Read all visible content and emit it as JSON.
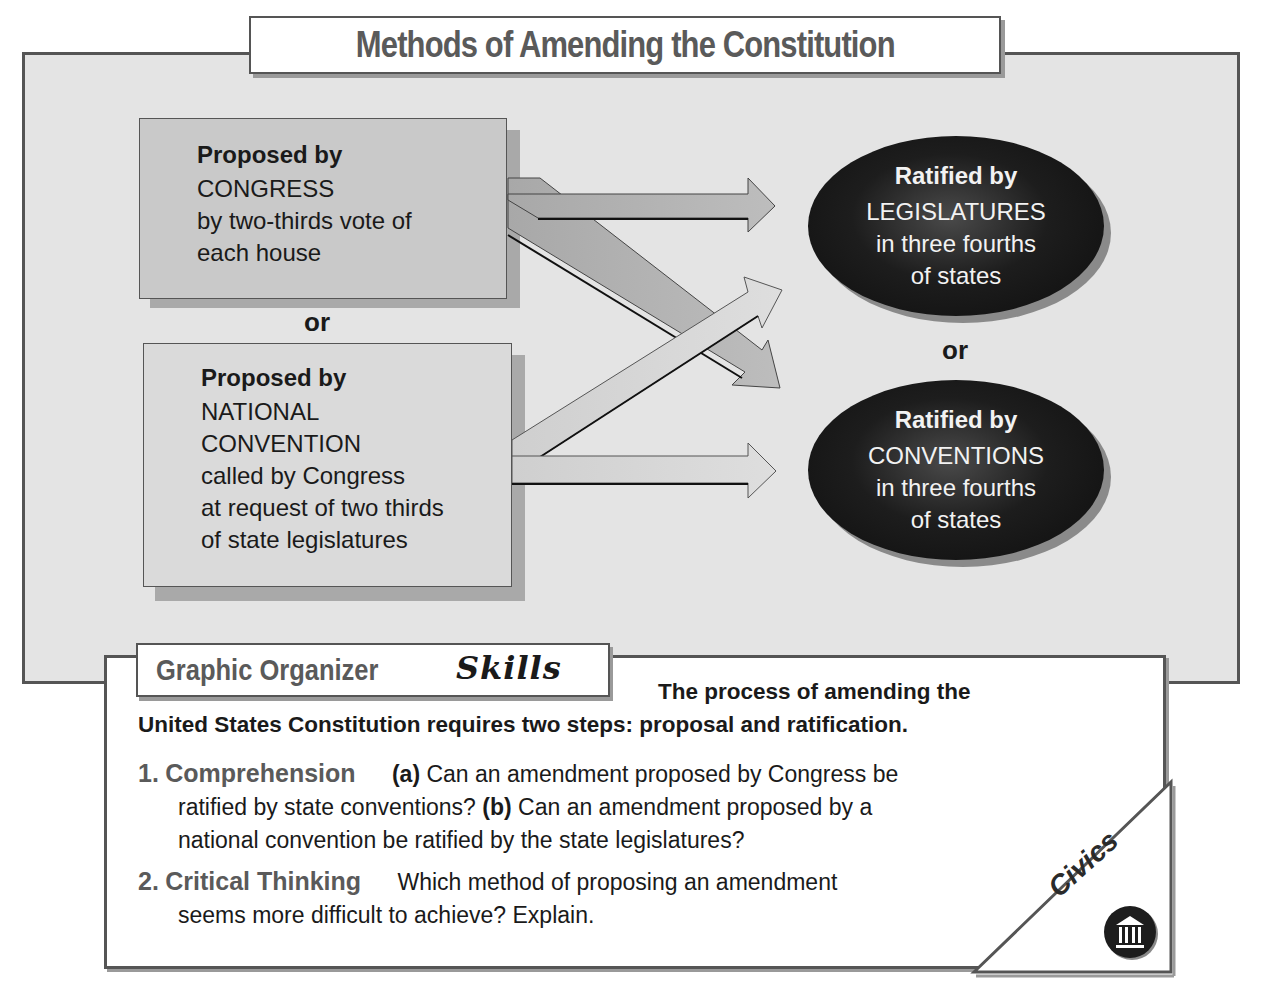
{
  "title": "Methods of Amending the Constitution",
  "proposal": {
    "congress": {
      "heading": "Proposed by",
      "lines": [
        "CONGRESS",
        "by two-thirds vote of",
        "each house"
      ]
    },
    "or": "or",
    "convention": {
      "heading": "Proposed by",
      "lines": [
        "NATIONAL",
        "CONVENTION",
        "called by Congress",
        "at request of two thirds",
        "of state legislatures"
      ]
    }
  },
  "ratification": {
    "legislatures": {
      "heading": "Ratified by",
      "lines": [
        "LEGISLATURES",
        "in three fourths",
        "of states"
      ]
    },
    "or": "or",
    "conventions": {
      "heading": "Ratified by",
      "lines": [
        "CONVENTIONS",
        "in three fourths",
        "of states"
      ]
    }
  },
  "arrows": [
    {
      "from": "congress",
      "to": "legislatures"
    },
    {
      "from": "congress",
      "to": "conventions"
    },
    {
      "from": "convention",
      "to": "legislatures"
    },
    {
      "from": "convention",
      "to": "conventions"
    }
  ],
  "colors": {
    "panel_bg": "#e4e4e4",
    "congress_box": "#c9c9c9",
    "convention_box": "#dadada",
    "ellipse": "#111111",
    "title_text": "#5a5a5a",
    "border": "#555555"
  },
  "skills": {
    "label": "Graphic Organizer",
    "label_script": "Skills",
    "intro_line1": "The process of amending the",
    "intro_line2": "United States Constitution requires two steps: proposal and ratification.",
    "questions": [
      {
        "number": "1.",
        "title": "Comprehension",
        "part_a_label": "(a)",
        "part_a_text_1": "Can an amendment proposed by Congress be",
        "part_a_text_2": "ratified by state conventions?",
        "part_b_label": "(b)",
        "part_b_text_1": "Can an amendment proposed by a",
        "part_b_text_2": "national convention be ratified by the state legislatures?"
      },
      {
        "number": "2.",
        "title": "Critical Thinking",
        "text_1": "Which method of proposing an amendment",
        "text_2": "seems more difficult to achieve? Explain."
      }
    ],
    "badge": {
      "label": "Civics",
      "icon": "capitol-building-icon"
    }
  }
}
